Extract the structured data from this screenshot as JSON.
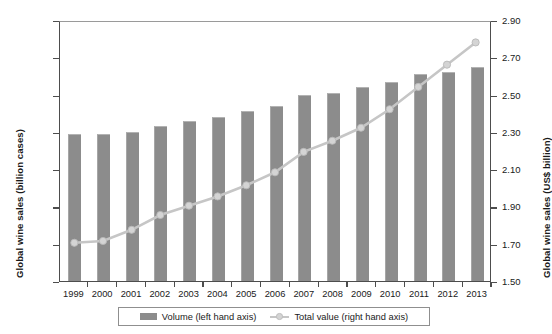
{
  "chart_data": {
    "type": "bar",
    "title": "",
    "xlabel": "",
    "ylabel": "Global wine sales (billion cases)",
    "y2label": "Global wine sales (US$ billion)",
    "categories": [
      "1999",
      "2000",
      "2001",
      "2002",
      "2003",
      "2004",
      "2005",
      "2006",
      "2007",
      "2008",
      "2009",
      "2010",
      "2011",
      "2012",
      "2013"
    ],
    "ylim": [
      1.5,
      2.9
    ],
    "y2lim": [
      1.5,
      2.9
    ],
    "yticks": [
      "2.90",
      "2.70",
      "2.50",
      "2.30",
      "2.10",
      "1.90",
      "1.70",
      "1.50"
    ],
    "y2ticks": [
      "2.90",
      "2.70",
      "2.50",
      "2.30",
      "2.10",
      "1.90",
      "1.70",
      "1.50"
    ],
    "ytick_values": [
      2.9,
      2.7,
      2.5,
      2.3,
      2.1,
      1.9,
      1.7,
      1.5
    ],
    "grid": false,
    "legend_position": "bottom",
    "series": [
      {
        "name": "Volume (left hand axis)",
        "type": "bar",
        "axis": "left",
        "color": "#8c8c8c",
        "values": [
          2.29,
          2.29,
          2.3,
          2.33,
          2.36,
          2.38,
          2.41,
          2.44,
          2.5,
          2.51,
          2.54,
          2.57,
          2.61,
          2.62,
          2.65
        ]
      },
      {
        "name": "Total value (right hand axis)",
        "type": "line",
        "axis": "right",
        "color": "#c6c6c6",
        "marker_color": "#d4d4d4",
        "values": [
          1.71,
          1.72,
          1.78,
          1.86,
          1.91,
          1.96,
          2.02,
          2.09,
          2.2,
          2.26,
          2.33,
          2.43,
          2.55,
          2.67,
          2.79
        ]
      }
    ]
  }
}
